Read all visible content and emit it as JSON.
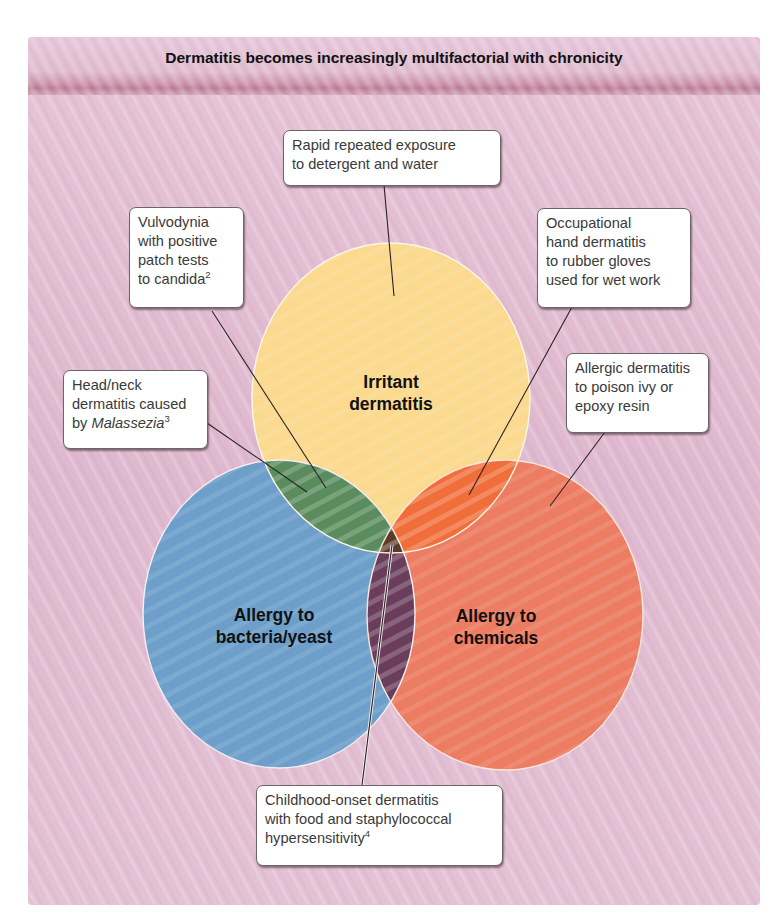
{
  "header": {
    "title": "Dermatitis becomes increasingly multifactorial with chronicity"
  },
  "colors": {
    "panel_background": "#e3bfd3",
    "header_band": "#b9768f",
    "irritant_circle": "#fbd98e",
    "bacteria_circle": "#6d9fca",
    "chemicals_circle": "#ec7c62",
    "irritant_bacteria_overlap": "#5a8c5d",
    "irritant_chemicals_overlap": "#f06e3a",
    "bacteria_chemicals_overlap": "#6a3d5c",
    "center_overlap": "#5b3a28",
    "callout_border": "#6d6468",
    "text": "#111111"
  },
  "circles": {
    "irritant": {
      "label_line1": "Irritant",
      "label_line2": "dermatitis"
    },
    "bacteria": {
      "label_line1": "Allergy to",
      "label_line2": "bacteria/yeast"
    },
    "chemicals": {
      "label_line1": "Allergy to",
      "label_line2": "chemicals"
    }
  },
  "callouts": {
    "rapid": {
      "line1": "Rapid repeated exposure",
      "line2": "to detergent and water"
    },
    "vulvodynia": {
      "line1": "Vulvodynia",
      "line2": "with positive",
      "line3": "patch tests",
      "line4": "to candida",
      "superscript": "2"
    },
    "occupational": {
      "line1": "Occupational",
      "line2": "hand dermatitis",
      "line3": "to rubber gloves",
      "line4": "used for wet work"
    },
    "allergic": {
      "line1": "Allergic dermatitis",
      "line2": "to poison ivy or",
      "line3": "epoxy resin"
    },
    "headneck": {
      "line1": "Head/neck",
      "line2": "dermatitis caused",
      "line3_prefix": "by ",
      "line3_italic": "Malassezia",
      "superscript": "3"
    },
    "childhood": {
      "line1": "Childhood-onset dermatitis",
      "line2": "with food and staphylococcal",
      "line3": "hypersensitivity",
      "superscript": "4"
    }
  }
}
